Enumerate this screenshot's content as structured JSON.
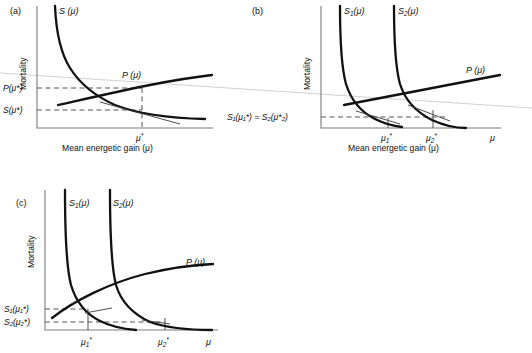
{
  "figure": {
    "background_color": "#ffffff",
    "curve_color": "#111111",
    "axis_color": "#7c7c7c",
    "dashed_color": "#555555",
    "scanline_color": "#c9c9c9"
  },
  "panels": [
    {
      "id": "a",
      "label": "(a)",
      "y_axis_label": "Mortality",
      "x_axis_label": "Mean energetic gain (μ)",
      "curves": [
        {
          "name": "S-curve",
          "label": "S",
          "label_arg": "(μ)",
          "type": "decreasing-hyperbola"
        },
        {
          "name": "P-curve",
          "label": "P",
          "label_arg": "(μ)",
          "type": "increasing-concave"
        }
      ],
      "value_labels": [
        {
          "name": "p-star",
          "base": "P",
          "arg": "(μ*)"
        },
        {
          "name": "s-star",
          "base": "S",
          "arg": "(μ*)"
        }
      ],
      "x_ticks": [
        {
          "name": "mu-star",
          "base": "μ",
          "sup": "*",
          "sub": ""
        }
      ],
      "x_end_label": ""
    },
    {
      "id": "b",
      "label": "(b)",
      "y_axis_label": "Mortality",
      "x_axis_label": "Mean energetic gain (μ)",
      "curves": [
        {
          "name": "S1-curve",
          "label": "S",
          "sub": "1",
          "label_arg": "(μ)",
          "type": "decreasing-hyperbola"
        },
        {
          "name": "S2-curve",
          "label": "S",
          "sub": "2",
          "label_arg": "(μ)",
          "type": "decreasing-hyperbola"
        },
        {
          "name": "P-curve",
          "label": "P",
          "label_arg": "(μ)",
          "type": "increasing-linear"
        }
      ],
      "equality_label": "S₁(μ₁*) = S₂(μ*₂)",
      "x_ticks": [
        {
          "name": "mu1-star",
          "base": "μ",
          "sub": "1",
          "sup": "*"
        },
        {
          "name": "mu2-star",
          "base": "μ",
          "sub": "2",
          "sup": "*"
        }
      ],
      "x_end_label": "μ"
    },
    {
      "id": "c",
      "label": "(c)",
      "y_axis_label": "Mortality",
      "x_axis_label": "",
      "curves": [
        {
          "name": "S1-curve",
          "label": "S",
          "sub": "1",
          "label_arg": "(μ)",
          "type": "decreasing-hyperbola"
        },
        {
          "name": "S2-curve",
          "label": "S",
          "sub": "2",
          "label_arg": "(μ)",
          "type": "decreasing-hyperbola"
        },
        {
          "name": "P-curve",
          "label": "P",
          "label_arg": "(μ)",
          "type": "increasing-concave"
        }
      ],
      "value_labels": [
        {
          "name": "s1-mu1-star",
          "text": "S₁(μ₁*)"
        },
        {
          "name": "s2-mu2-star",
          "text": "S₂(μ₂*)"
        }
      ],
      "x_ticks": [
        {
          "name": "mu1-star",
          "base": "μ",
          "sub": "1",
          "sup": "*"
        },
        {
          "name": "mu2-star",
          "base": "μ",
          "sub": "2",
          "sup": "*"
        }
      ],
      "x_end_label": "μ"
    }
  ],
  "text": {
    "panel_a_letter": "(a)",
    "panel_b_letter": "(b)",
    "panel_c_letter": "(c)",
    "mortality": "Mortality",
    "mean_energetic_gain": "Mean energetic gain (μ)",
    "S_mu": "S (μ)",
    "P_mu": "P (μ)",
    "S1_mu": "S",
    "S2_mu": "S",
    "S_paren_mu": "(μ)",
    "sub1": "1",
    "sub2": "2",
    "P_mu_star_base": "P",
    "P_mu_star_arg": "(μ*)",
    "S_mu_star_base": "S",
    "S_mu_star_arg": "(μ*)",
    "mu": "μ",
    "star": "*",
    "eq_sign": "=",
    "paren_open": "(",
    "paren_close": ")"
  }
}
